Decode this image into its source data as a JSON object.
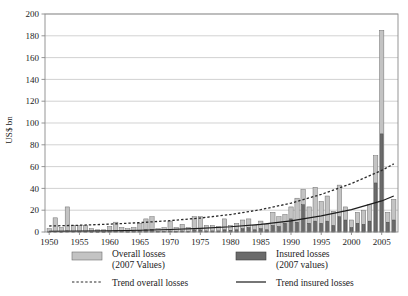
{
  "chart_data": {
    "type": "bar",
    "title": "",
    "xlabel": "",
    "ylabel": "US$ bn",
    "ylim": [
      0,
      200
    ],
    "ytick_step": 20,
    "yticks": [
      0,
      20,
      40,
      60,
      80,
      100,
      120,
      140,
      160,
      180,
      200
    ],
    "xlim": [
      1949.3,
      2007.7
    ],
    "xticks": [
      1950,
      1955,
      1960,
      1965,
      1970,
      1975,
      1980,
      1985,
      1990,
      1995,
      2000,
      2005
    ],
    "grid": "horizontal",
    "legend_position": "below-axes",
    "bar_overlap": "overlaid",
    "x": [
      1950,
      1951,
      1952,
      1953,
      1954,
      1955,
      1956,
      1957,
      1958,
      1959,
      1960,
      1961,
      1962,
      1963,
      1964,
      1965,
      1966,
      1967,
      1968,
      1969,
      1970,
      1971,
      1972,
      1973,
      1974,
      1975,
      1976,
      1977,
      1978,
      1979,
      1980,
      1981,
      1982,
      1983,
      1984,
      1985,
      1986,
      1987,
      1988,
      1989,
      1990,
      1991,
      1992,
      1993,
      1994,
      1995,
      1996,
      1997,
      1998,
      1999,
      2000,
      2001,
      2002,
      2003,
      2004,
      2005,
      2006,
      2007
    ],
    "series": [
      {
        "name": "Overall losses (2007 Values)",
        "color": "#c3c3c3",
        "edge": "#6e6e6e",
        "values": [
          3,
          13,
          4,
          23,
          6,
          6,
          6,
          3,
          2,
          2,
          5,
          9,
          4,
          3,
          4,
          8,
          12,
          14,
          3,
          4,
          10,
          4,
          7,
          4,
          14,
          14,
          6,
          6,
          5,
          12,
          6,
          8,
          11,
          12,
          6,
          10,
          7,
          18,
          14,
          16,
          23,
          31,
          39,
          23,
          41,
          28,
          33,
          19,
          43,
          23,
          11,
          18,
          20,
          25,
          70,
          185,
          18,
          30
        ]
      },
      {
        "name": "Insured losses (2007 values)",
        "color": "#6b6b6b",
        "edge": "#3c3c3c",
        "values": [
          0.2,
          0.5,
          0.3,
          1,
          0.5,
          0.5,
          0.5,
          0.3,
          0.2,
          0.2,
          0.5,
          1,
          0.6,
          0.4,
          0.5,
          1.5,
          2,
          2.5,
          0.5,
          0.6,
          1,
          0.5,
          1,
          0.5,
          2,
          2,
          1,
          1,
          1,
          2,
          1.5,
          2,
          3,
          4,
          2,
          3,
          2,
          6,
          5,
          8,
          12,
          9,
          25,
          8,
          10,
          8,
          10,
          6,
          14,
          11,
          4,
          8,
          7,
          10,
          45,
          90,
          9,
          11
        ]
      }
    ],
    "trend_lines": [
      {
        "name": "Trend overall losses",
        "style": "dashed",
        "color": "#2a2a2a",
        "points": [
          [
            1950,
            5.5
          ],
          [
            1955,
            6.2
          ],
          [
            1960,
            7.2
          ],
          [
            1965,
            8.6
          ],
          [
            1970,
            10.4
          ],
          [
            1975,
            12.8
          ],
          [
            1980,
            16.0
          ],
          [
            1985,
            20.5
          ],
          [
            1990,
            26.5
          ],
          [
            1995,
            34.5
          ],
          [
            2000,
            44.5
          ],
          [
            2005,
            56.5
          ],
          [
            2007,
            62.5
          ]
        ]
      },
      {
        "name": "Trend insured losses",
        "style": "solid",
        "color": "#1c1c1c",
        "points": [
          [
            1950,
            0.6
          ],
          [
            1955,
            0.8
          ],
          [
            1960,
            1.1
          ],
          [
            1965,
            1.6
          ],
          [
            1970,
            2.3
          ],
          [
            1975,
            3.3
          ],
          [
            1980,
            4.8
          ],
          [
            1985,
            7.0
          ],
          [
            1990,
            10.2
          ],
          [
            1995,
            14.8
          ],
          [
            2000,
            20.5
          ],
          [
            2005,
            28.5
          ],
          [
            2007,
            33.0
          ]
        ]
      }
    ]
  },
  "axis": {
    "y_title": "US$ bn",
    "y_tick_labels": [
      "0",
      "20",
      "40",
      "60",
      "80",
      "100",
      "120",
      "140",
      "160",
      "180",
      "200"
    ],
    "x_tick_labels": [
      "1950",
      "1955",
      "1960",
      "1965",
      "1970",
      "1975",
      "1980",
      "1985",
      "1990",
      "1995",
      "2000",
      "2005"
    ]
  },
  "legend": {
    "entries": [
      {
        "key": "overall-losses",
        "marker": "light-gray-bar-swatch",
        "line1": "Overall losses",
        "line2": "(2007 Values)"
      },
      {
        "key": "insured-losses",
        "marker": "dark-gray-bar-swatch",
        "line1": "Insured losses",
        "line2": "(2007 values)"
      },
      {
        "key": "trend-overall",
        "marker": "dashed-line-swatch",
        "line1": "Trend overall losses",
        "line2": ""
      },
      {
        "key": "trend-insured",
        "marker": "solid-line-swatch",
        "line1": "Trend insured losses",
        "line2": ""
      }
    ]
  },
  "colors": {
    "overall_fill": "#c3c3c3",
    "overall_edge": "#6e6e6e",
    "insured_fill": "#6b6b6b",
    "insured_edge": "#3c3c3c",
    "grid": "#bfbfbf",
    "axis": "#8a8a8a",
    "text": "#1a1a1a",
    "background": "#ffffff"
  }
}
